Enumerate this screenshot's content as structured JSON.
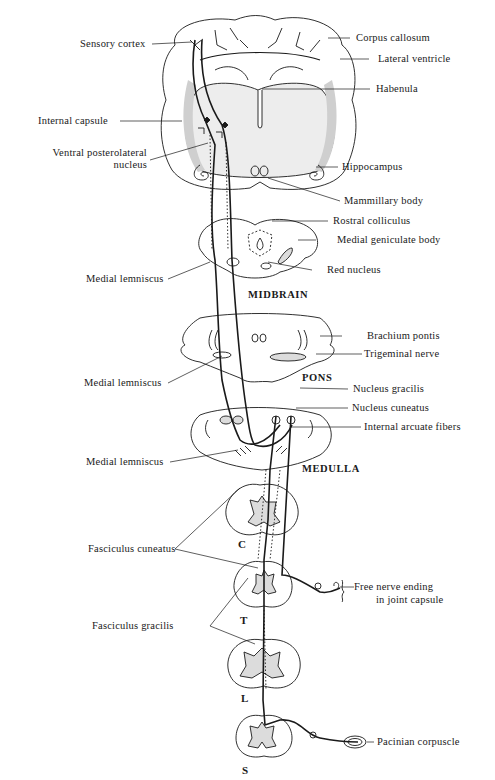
{
  "figure": {
    "colors": {
      "ink": "#1a1a1a",
      "shade": "#d9d9d9",
      "background": "#ffffff"
    }
  },
  "labels_left": {
    "sensory_cortex": "Sensory cortex",
    "internal_capsule": "Internal capsule",
    "vpl_line1": "Ventral posterolateral",
    "vpl_line2": "nucleus",
    "medial_lemniscus_midbrain": "Medial lemniscus",
    "medial_lemniscus_pons": "Medial lemniscus",
    "medial_lemniscus_medulla": "Medial lemniscus",
    "fasciculus_cuneatus": "Fasciculus cuneatus",
    "fasciculus_gracilis": "Fasciculus gracilis"
  },
  "labels_right": {
    "corpus_callosum": "Corpus callosum",
    "lateral_ventricle": "Lateral ventricle",
    "habenula": "Habenula",
    "hippocampus": "Hippocampus",
    "mammillary_body": "Mammillary body",
    "rostral_colliculus": "Rostral colliculus",
    "medial_geniculate_body": "Medial geniculate body",
    "red_nucleus": "Red nucleus",
    "brachium_pontis": "Brachium pontis",
    "trigeminal_nerve": "Trigeminal nerve",
    "nucleus_gracilis": "Nucleus gracilis",
    "nucleus_cuneatus": "Nucleus cuneatus",
    "internal_arcuate_fibers": "Internal arcuate fibers",
    "free_nerve_ending_line1": "Free nerve ending",
    "free_nerve_ending_line2": "in joint capsule",
    "pacinian_corpuscle": "Pacinian corpuscle"
  },
  "sections": {
    "midbrain": "MIDBRAIN",
    "pons": "PONS",
    "medulla": "MEDULLA"
  },
  "spinal_levels": [
    "C",
    "T",
    "L",
    "S"
  ]
}
